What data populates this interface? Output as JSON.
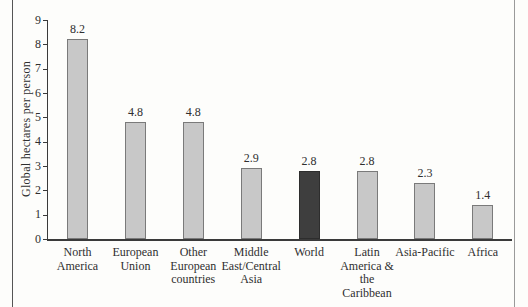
{
  "figure": {
    "kind": "scanned-book-bar-chart",
    "colors": {
      "background": "#fdfdfb",
      "text": "#2f2f2f",
      "axis": "#3a3a3a",
      "bar_fill": "#c8c8c8",
      "bar_border": "#7a7a7a",
      "highlight_fill": "#3e3e3e",
      "highlight_border": "#2d2d2d",
      "page_rule_left": "#555555",
      "page_rule_right": "#9a9a9a"
    }
  },
  "chart_data": {
    "type": "bar",
    "title": "",
    "xlabel": "",
    "ylabel": "Global hectares per person",
    "ylim": [
      0,
      9
    ],
    "ytick_interval": 1,
    "ytick_labels": [
      "0",
      "1",
      "2",
      "3",
      "4",
      "5",
      "6",
      "7",
      "8",
      "9"
    ],
    "grid": false,
    "legend": null,
    "categories": [
      "North America",
      "European Union",
      "Other European countries",
      "Middle East/Central Asia",
      "World",
      "Latin America & the Caribbean",
      "Asia-Pacific",
      "Africa"
    ],
    "category_label_lines": [
      [
        "North",
        "America"
      ],
      [
        "European",
        "Union"
      ],
      [
        "Other",
        "European",
        "countries"
      ],
      [
        "Middle",
        "East/Central",
        "Asia"
      ],
      [
        "World"
      ],
      [
        "Latin",
        "America &",
        "the",
        "Caribbean"
      ],
      [
        "Asia-Pacific"
      ],
      [
        "Africa"
      ]
    ],
    "values": [
      8.2,
      4.8,
      4.8,
      2.9,
      2.8,
      2.8,
      2.3,
      1.4
    ],
    "data_labels": [
      "8.2",
      "4.8",
      "4.8",
      "2.9",
      "2.8",
      "2.8",
      "2.3",
      "1.4"
    ],
    "highlighted_category": "World"
  }
}
